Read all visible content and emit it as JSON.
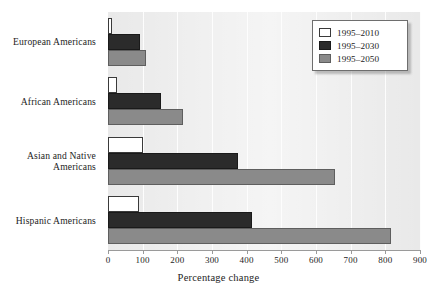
{
  "chart_data": {
    "type": "bar",
    "orientation": "horizontal",
    "title": "",
    "xlabel": "Percentage change",
    "ylabel": "",
    "xlim": [
      0,
      900
    ],
    "xticks": [
      0,
      100,
      200,
      300,
      400,
      500,
      600,
      700,
      800,
      900
    ],
    "xticklabels": [
      "0",
      "100",
      "200",
      "300",
      "400",
      "500",
      "600",
      "700",
      "800",
      "900"
    ],
    "grid": "vertical",
    "categories": [
      "European Americans",
      "African Americans",
      "Asian and Native Americans",
      "Hispanic Americans"
    ],
    "category_lines": [
      [
        "European Americans"
      ],
      [
        "African Americans"
      ],
      [
        "Asian and Native",
        "Americans"
      ],
      [
        "Hispanic Americans"
      ]
    ],
    "series": [
      {
        "name": "1995–2010",
        "color": "#ffffff",
        "values": [
          12,
          25,
          100,
          90
        ]
      },
      {
        "name": "1995–2030",
        "color": "#2b2b2b",
        "values": [
          92,
          152,
          375,
          415
        ]
      },
      {
        "name": "1995–2050",
        "color": "#8a8a8a",
        "values": [
          110,
          215,
          655,
          815
        ]
      }
    ],
    "legend": {
      "position": "top-right",
      "entries": [
        "1995–2010",
        "1995–2030",
        "1995–2050"
      ]
    },
    "colors": {
      "plot_background": "#e9e9e9",
      "gridline": "#fdfdfd",
      "axis": "#9a9a9a",
      "text": "#1d1d1d",
      "series_1995_2010": "#ffffff",
      "series_1995_2030": "#2b2b2b",
      "series_1995_2050": "#8a8a8a"
    }
  }
}
